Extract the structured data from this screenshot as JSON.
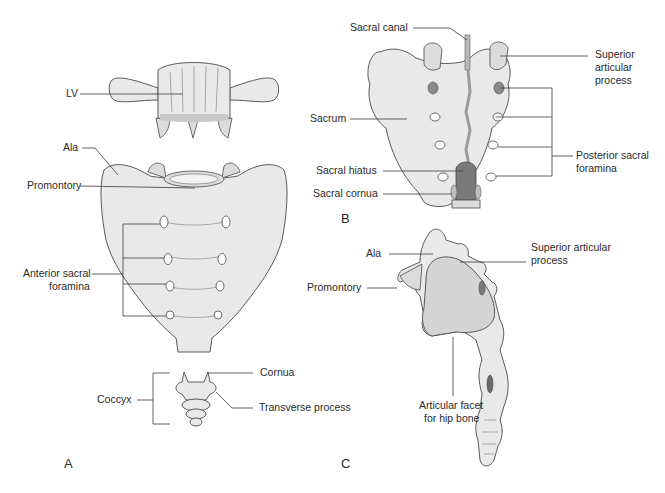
{
  "figure": {
    "panels": [
      {
        "id": "A",
        "label": "A",
        "view": "anterior",
        "labels": {
          "lv": "LV",
          "ala": "Ala",
          "promontory": "Promontory",
          "anterior_sacral_foramina_1": "Anterior sacral",
          "anterior_sacral_foramina_2": "foramina",
          "coccyx": "Coccyx",
          "cornua": "Cornua",
          "transverse_process": "Transverse process"
        }
      },
      {
        "id": "B",
        "label": "B",
        "view": "posterior",
        "labels": {
          "sacral_canal": "Sacral canal",
          "superior_articular_process_1": "Superior",
          "superior_articular_process_2": "articular",
          "superior_articular_process_3": "process",
          "sacrum": "Sacrum",
          "posterior_sacral_foramina_1": "Posterior sacral",
          "posterior_sacral_foramina_2": "foramina",
          "sacral_hiatus": "Sacral hiatus",
          "sacral_cornua": "Sacral cornua"
        }
      },
      {
        "id": "C",
        "label": "C",
        "view": "lateral",
        "labels": {
          "ala": "Ala",
          "superior_articular_process_1": "Superior articular",
          "superior_articular_process_2": "process",
          "promontory": "Promontory",
          "articular_facet_1": "Articular facet",
          "articular_facet_2": "for hip bone"
        }
      }
    ]
  },
  "colors": {
    "bone": "#e9e9e9",
    "outline": "#5a5a5a",
    "text": "#2a2a2a",
    "background": "#ffffff"
  }
}
